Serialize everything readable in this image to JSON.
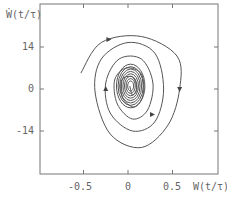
{
  "chart_data": {
    "type": "line",
    "title": "",
    "xlabel": "W(t/τ)",
    "ylabel": "Ẇ(t/τ)",
    "xlim": [
      -0.92,
      1.1
    ],
    "ylim": [
      -26,
      25
    ],
    "x_ticks": [
      "-0.5",
      "0",
      "0.5"
    ],
    "y_ticks": [
      "14",
      "0",
      "-14"
    ],
    "grid": false,
    "legend": null,
    "series": [
      {
        "name": "trajectory",
        "points": [
          [
            -0.53,
            5.3
          ],
          [
            -0.3,
            15.5
          ],
          [
            0.15,
            17.5
          ],
          [
            0.55,
            11
          ],
          [
            0.58,
            0
          ],
          [
            0.45,
            -12
          ],
          [
            0.15,
            -19.5
          ],
          [
            -0.2,
            -15
          ],
          [
            -0.37,
            -1
          ],
          [
            -0.3,
            10
          ],
          [
            0.0,
            15.5
          ],
          [
            0.3,
            12
          ],
          [
            0.4,
            0
          ],
          [
            0.3,
            -11
          ],
          [
            0.05,
            -14
          ],
          [
            -0.2,
            -8
          ],
          [
            -0.25,
            2
          ],
          [
            -0.1,
            10
          ],
          [
            0.15,
            10
          ],
          [
            0.28,
            2
          ],
          [
            0.22,
            -7
          ],
          [
            0.05,
            -10
          ],
          [
            -0.12,
            -5
          ],
          [
            -0.15,
            3
          ],
          [
            -0.02,
            7
          ],
          [
            0.15,
            5
          ],
          [
            0.17,
            -2
          ],
          [
            0.07,
            -6
          ],
          [
            -0.06,
            -3
          ],
          [
            -0.07,
            3
          ],
          [
            0.05,
            4
          ],
          [
            0.1,
            0
          ],
          [
            0.05,
            -2
          ],
          [
            0.02,
            1
          ]
        ]
      }
    ],
    "arrows": [
      {
        "x": -0.22,
        "y": 16.5,
        "direction": "right"
      },
      {
        "x": 0.58,
        "y": 0,
        "direction": "down"
      },
      {
        "x": -0.25,
        "y": 0,
        "direction": "up"
      },
      {
        "x": 0.27,
        "y": -8.5,
        "direction": "right"
      }
    ]
  },
  "axes": {
    "x_ticks": [
      "-0.5",
      "0",
      "0.5"
    ],
    "y_ticks": [
      "14",
      "0",
      "-14"
    ],
    "xlabel": "W(t/τ)",
    "ylabel": "Ẇ(t/τ)"
  }
}
